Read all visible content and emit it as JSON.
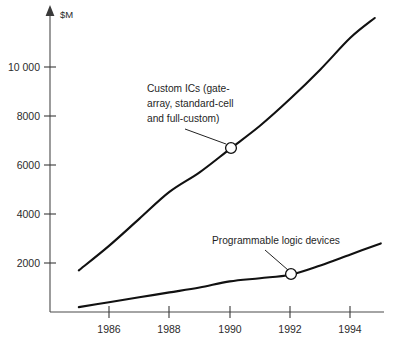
{
  "chart_data": {
    "type": "line",
    "title": "",
    "xlabel": "",
    "ylabel": "$M",
    "ylim": [
      0,
      11500
    ],
    "xlim": [
      1985,
      1995
    ],
    "grid": false,
    "legend": "annotations",
    "y_unit_label": "$M",
    "y_ticks": [
      2000,
      4000,
      6000,
      8000,
      10000
    ],
    "y_tick_labels": [
      "2000",
      "4000",
      "6000",
      "8000",
      "10 000"
    ],
    "x_ticks": [
      1986,
      1988,
      1990,
      1992,
      1994
    ],
    "x_tick_labels": [
      "1986",
      "1988",
      "1990",
      "1992",
      "1994"
    ],
    "series": [
      {
        "name": "Custom ICs (gate-array, standard-cell and full-custom)",
        "x": [
          1985.0,
          1986.0,
          1987.0,
          1988.0,
          1989.0,
          1990.0,
          1991.0,
          1992.0,
          1993.0,
          1994.0,
          1994.8
        ],
        "values": [
          1700,
          2700,
          3800,
          4900,
          5700,
          6650,
          7600,
          8700,
          9900,
          11200,
          12000
        ]
      },
      {
        "name": "Programmable logic devices",
        "x": [
          1985.0,
          1986.0,
          1987.0,
          1988.0,
          1989.0,
          1990.0,
          1991.0,
          1992.0,
          1993.0,
          1994.0,
          1995.0
        ],
        "values": [
          200,
          400,
          600,
          800,
          1000,
          1250,
          1380,
          1520,
          1900,
          2350,
          2800
        ]
      }
    ],
    "annotations": [
      {
        "id": "custom-ics",
        "text_lines": [
          "Custom ICs (gate-",
          "array, standard-cell",
          "and full-custom)"
        ],
        "point": {
          "x": 1990,
          "y": 6650
        },
        "marker": "circle"
      },
      {
        "id": "programmable-logic-devices",
        "text_lines": [
          "Programmable logic devices"
        ],
        "point": {
          "x": 1992,
          "y": 1520
        },
        "marker": "circle"
      }
    ],
    "colors": {
      "line": "#111111",
      "axis": "#4a4a4a",
      "text": "#1f1f1f",
      "background": "#ffffff"
    }
  }
}
